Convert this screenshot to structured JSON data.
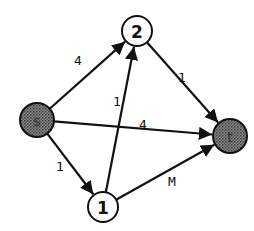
{
  "diagram": {
    "type": "flow-network",
    "nodes": [
      {
        "id": "s",
        "label": "s",
        "x": 37,
        "y": 120,
        "r": 17,
        "shaded": true
      },
      {
        "id": "2",
        "label": "2",
        "x": 137,
        "y": 31,
        "r": 15,
        "shaded": false
      },
      {
        "id": "t",
        "label": "t",
        "x": 230,
        "y": 136,
        "r": 17,
        "shaded": true
      },
      {
        "id": "1",
        "label": "1",
        "x": 103,
        "y": 207,
        "r": 15,
        "shaded": false
      }
    ],
    "edges": [
      {
        "from": "s",
        "to": "2",
        "label": "4",
        "lx": 78,
        "ly": 60
      },
      {
        "from": "s",
        "to": "t",
        "label": "4",
        "lx": 143,
        "ly": 124
      },
      {
        "from": "s",
        "to": "1",
        "label": "1",
        "lx": 60,
        "ly": 166
      },
      {
        "from": "1",
        "to": "2",
        "label": "1",
        "lx": 117,
        "ly": 101
      },
      {
        "from": "2",
        "to": "t",
        "label": "1",
        "lx": 182,
        "ly": 77
      },
      {
        "from": "1",
        "to": "t",
        "label": "M",
        "lx": 172,
        "ly": 181
      }
    ]
  }
}
